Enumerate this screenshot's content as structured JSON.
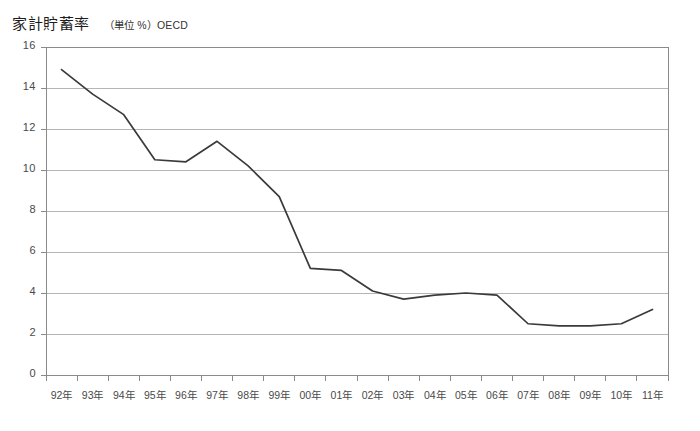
{
  "header": {
    "title": "家計貯蓄率",
    "subtitle": "（単位 %）OECD"
  },
  "chart_data": {
    "type": "line",
    "title": "家計貯蓄率",
    "subtitle": "（単位 %）OECD",
    "xlabel": "",
    "ylabel": "",
    "unit": "%",
    "source": "OECD",
    "grid": true,
    "legend": "none",
    "line_color": "#3a3a3a",
    "grid_color": "#b5b5b5",
    "axis_color": "#8a8a8a",
    "ylim": [
      0,
      16
    ],
    "yticks": [
      0,
      2,
      4,
      6,
      8,
      10,
      12,
      14,
      16
    ],
    "ytick_labels": [
      "0",
      "2",
      "4",
      "6",
      "8",
      "10",
      "12",
      "14",
      "16"
    ],
    "categories": [
      "92年",
      "93年",
      "94年",
      "95年",
      "96年",
      "97年",
      "98年",
      "99年",
      "00年",
      "01年",
      "02年",
      "03年",
      "04年",
      "05年",
      "06年",
      "07年",
      "08年",
      "09年",
      "10年",
      "11年"
    ],
    "values": [
      14.9,
      13.7,
      12.7,
      10.5,
      10.4,
      11.4,
      10.2,
      8.7,
      5.2,
      5.1,
      4.1,
      3.7,
      3.9,
      4.0,
      3.9,
      2.5,
      2.4,
      2.4,
      2.5,
      3.2
    ]
  }
}
